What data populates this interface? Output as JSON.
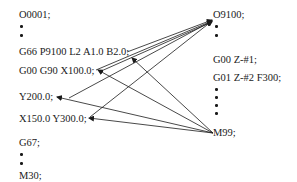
{
  "main_program": {
    "lines": [
      {
        "text": "O0001;",
        "x": 19,
        "y": 9
      },
      {
        "text": "G66 P9100 L2 A1.0 B2.0;",
        "x": 19,
        "y": 46
      },
      {
        "text": "G00 G90 X100.0;",
        "x": 19,
        "y": 65
      },
      {
        "text": "Y200.0;",
        "x": 19,
        "y": 91
      },
      {
        "text": "X150.0 Y300.0;",
        "x": 19,
        "y": 113
      },
      {
        "text": "G67;",
        "x": 19,
        "y": 137
      },
      {
        "text": "M30;",
        "x": 19,
        "y": 170
      }
    ],
    "dots": [
      {
        "x": 20,
        "y": 25
      },
      {
        "x": 20,
        "y": 34
      },
      {
        "x": 20,
        "y": 153
      },
      {
        "x": 20,
        "y": 162
      }
    ]
  },
  "macro_program": {
    "lines": [
      {
        "text": "O9100;",
        "x": 213,
        "y": 9
      },
      {
        "text": "G00 Z-#1;",
        "x": 213,
        "y": 54
      },
      {
        "text": "G01 Z-#2 F300;",
        "x": 213,
        "y": 72
      },
      {
        "text": "M99;",
        "x": 213,
        "y": 127
      }
    ],
    "dots": [
      {
        "x": 215,
        "y": 25
      },
      {
        "x": 215,
        "y": 34
      },
      {
        "x": 215,
        "y": 88
      },
      {
        "x": 215,
        "y": 96
      },
      {
        "x": 215,
        "y": 104
      },
      {
        "x": 215,
        "y": 112
      },
      {
        "x": 215,
        "y": 120
      }
    ]
  }
}
